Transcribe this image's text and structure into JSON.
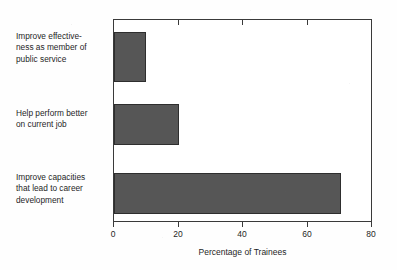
{
  "chart_data": {
    "type": "bar",
    "orientation": "horizontal",
    "title": "",
    "subtitle": "",
    "xlabel": "Percentage of Trainees",
    "ylabel": "",
    "xlim": [
      0,
      80
    ],
    "xticks": [
      0,
      20,
      40,
      60,
      80
    ],
    "xtick_labels": [
      "0",
      "20",
      "40",
      "60",
      "80"
    ],
    "grid": false,
    "legend": false,
    "legend_position": "none",
    "bar_color": "#565656",
    "bar_edge_color": "#2e2e2e",
    "axis_color": "#3a3a3a",
    "background_color": "#ffffff",
    "categories": [
      "Improve effectiveness as member of public service",
      "Help perform better on current job",
      "Improve capacities that lead to career development"
    ],
    "values": [
      10,
      20,
      70
    ],
    "category_label_lines": [
      [
        "Improve effective-",
        "ness as member of",
        "public service"
      ],
      [
        "Help perform better",
        "on current job"
      ],
      [
        "Improve capacities",
        "that lead to career",
        "development"
      ]
    ],
    "bars": [
      {
        "label": "Improve effectiveness as member of public service",
        "value": 10
      },
      {
        "label": "Help perform better on current job",
        "value": 20
      },
      {
        "label": "Improve capacities that lead to career development",
        "value": 70
      }
    ]
  }
}
